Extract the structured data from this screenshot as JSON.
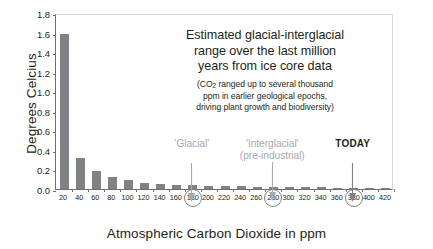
{
  "chart_data": {
    "type": "bar",
    "title": "",
    "xlabel": "Atmospheric Carbon Dioxide in ppm",
    "ylabel": "Degrees Celcius",
    "categories": [
      "20",
      "40",
      "60",
      "80",
      "100",
      "120",
      "140",
      "160",
      "180",
      "200",
      "220",
      "240",
      "260",
      "280",
      "300",
      "320",
      "340",
      "360",
      "380",
      "400",
      "420"
    ],
    "values": [
      1.59,
      0.32,
      0.18,
      0.12,
      0.09,
      0.065,
      0.055,
      0.045,
      0.04,
      0.032,
      0.03,
      0.026,
      0.024,
      0.022,
      0.02,
      0.018,
      0.016,
      0.014,
      0.013,
      0.012,
      0.011
    ],
    "ylim": [
      0.0,
      1.8
    ],
    "ytick_labels": [
      "0.0",
      "0.2",
      "0.4",
      "0.6",
      "0.8",
      "1.0",
      "1.2",
      "1.4",
      "1.6",
      "1.8"
    ],
    "ytick_values": [
      0.0,
      0.2,
      0.4,
      0.6,
      0.8,
      1.0,
      1.2,
      1.4,
      1.6,
      1.8
    ],
    "grid": false,
    "legend": "none",
    "bar_color": "#808285",
    "circled_categories": [
      "180",
      "280",
      "380"
    ],
    "annotations": [
      {
        "name": "main-note",
        "lines": [
          "Estimated glacial-interglacial",
          "range over the last million",
          "years from ice core data"
        ]
      },
      {
        "name": "sub-note",
        "lines": [
          "(CO2 ranged up to several thousand",
          "ppm in earlier geological epochs,",
          "driving plant growth and biodiversity)"
        ]
      },
      {
        "name": "pointer-glacial",
        "label": "'Glacial'",
        "label2": "",
        "at_category": "180",
        "color": "#a7a9ac",
        "bold": false
      },
      {
        "name": "pointer-interglacial",
        "label": "'Interglacial'",
        "label2": "(pre-industrial)",
        "at_category": "280",
        "color": "#a7a9ac",
        "bold": false
      },
      {
        "name": "pointer-today",
        "label": "TODAY",
        "label2": "",
        "at_category": "380",
        "color": "#231f20",
        "bold": true
      }
    ]
  },
  "annotation": {
    "main_line_1": "Estimated glacial-interglacial",
    "main_line_2": "range over the last million",
    "main_line_3": "years from ice core data",
    "sub_prefix": "(CO",
    "sub_subscript": "2",
    "sub_line_1_rest": " ranged up to several thousand",
    "sub_line_2": "ppm in earlier geological epochs,",
    "sub_line_3": "driving plant growth and biodiversity)"
  },
  "pointers": {
    "glacial": {
      "label": "'Glacial'",
      "sublabel": ""
    },
    "interglacial": {
      "label": "'Interglacial'",
      "sublabel": "(pre-industrial)"
    },
    "today": {
      "label": "TODAY",
      "sublabel": ""
    }
  },
  "axes": {
    "y_title": "Degrees Celcius",
    "x_title": "Atmospheric Carbon Dioxide in ppm"
  }
}
